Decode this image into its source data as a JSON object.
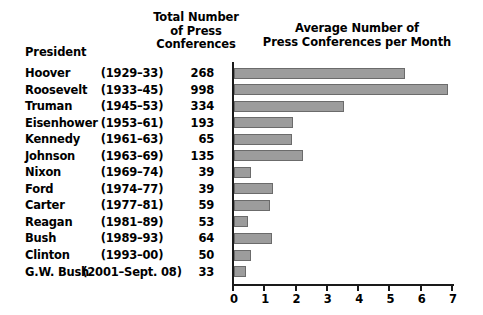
{
  "headers": {
    "president": "President",
    "total_line1": "Total Number",
    "total_line2": "of Press",
    "total_line3": "Conferences",
    "avg_line1": "Average Number of",
    "avg_line2": "Press Conferences per Month"
  },
  "colors": {
    "bar_fill": "#9c9c9c",
    "bar_stroke": "#6b6b6b",
    "axis": "#1a1a1a",
    "text": "#000000",
    "background": "#ffffff"
  },
  "rows": [
    {
      "name": "Hoover",
      "years": "(1929–33)",
      "total": "268",
      "avg": 5.45
    },
    {
      "name": "Roosevelt",
      "years": "(1933–45)",
      "total": "998",
      "avg": 6.85
    },
    {
      "name": "Truman",
      "years": "(1945–53)",
      "total": "334",
      "avg": 3.5
    },
    {
      "name": "Eisenhower",
      "years": "(1953–61)",
      "total": "193",
      "avg": 1.9
    },
    {
      "name": "Kennedy",
      "years": "(1961–63)",
      "total": "65",
      "avg": 1.85
    },
    {
      "name": "Johnson",
      "years": "(1963–69)",
      "total": "135",
      "avg": 2.2
    },
    {
      "name": "Nixon",
      "years": "(1969–74)",
      "total": "39",
      "avg": 0.55
    },
    {
      "name": "Ford",
      "years": "(1974–77)",
      "total": "39",
      "avg": 1.25
    },
    {
      "name": "Carter",
      "years": "(1977–81)",
      "total": "59",
      "avg": 1.15
    },
    {
      "name": "Reagan",
      "years": "(1981–89)",
      "total": "53",
      "avg": 0.45
    },
    {
      "name": "Bush",
      "years": "(1989–93)",
      "total": "64",
      "avg": 1.2
    },
    {
      "name": "Clinton",
      "years": "(1993–00)",
      "total": "50",
      "avg": 0.55
    },
    {
      "name": "G.W. Bush",
      "years": "(2001–Sept. 08)",
      "total": "33",
      "avg": 0.38
    }
  ],
  "chart_data": {
    "type": "bar",
    "orientation": "horizontal",
    "title": "Average Number of Press Conferences per Month",
    "xlabel": "",
    "ylabel": "",
    "xlim": [
      0,
      7
    ],
    "xticks": [
      0,
      1,
      2,
      3,
      4,
      5,
      6,
      7
    ],
    "xticklabels": [
      "0",
      "1",
      "2",
      "3",
      "4",
      "5",
      "6",
      "7"
    ],
    "grid": false,
    "legend": null,
    "categories": [
      "Hoover",
      "Roosevelt",
      "Truman",
      "Eisenhower",
      "Kennedy",
      "Johnson",
      "Nixon",
      "Ford",
      "Carter",
      "Reagan",
      "Bush",
      "Clinton",
      "G.W. Bush"
    ],
    "values": [
      5.45,
      6.85,
      3.5,
      1.9,
      1.85,
      2.2,
      0.55,
      1.25,
      1.15,
      0.45,
      1.2,
      0.55,
      0.38
    ],
    "table": {
      "columns": [
        "President",
        "Total Number of Press Conferences"
      ],
      "years": [
        "(1929–33)",
        "(1933–45)",
        "(1945–53)",
        "(1953–61)",
        "(1961–63)",
        "(1963–69)",
        "(1969–74)",
        "(1974–77)",
        "(1977–81)",
        "(1981–89)",
        "(1989–93)",
        "(1993–00)",
        "(2001–Sept. 08)"
      ],
      "totals": [
        268,
        998,
        334,
        193,
        65,
        135,
        39,
        39,
        59,
        53,
        64,
        50,
        33
      ]
    }
  }
}
